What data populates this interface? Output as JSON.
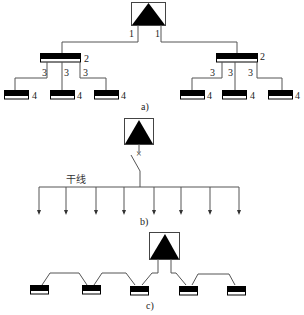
{
  "figure": {
    "colors": {
      "line": "#555555",
      "fill": "#000000",
      "background": "#ffffff"
    }
  },
  "panel_a": {
    "caption": "a)",
    "source_symbol": "transformer-triangle-box",
    "level_labels": {
      "feeder": "1",
      "sub_board": "2",
      "branch": "3",
      "load_board": "4"
    },
    "left_group": {
      "board_label": "2",
      "branch_labels": [
        "3",
        "3",
        "3"
      ],
      "load_labels": [
        "4",
        "4",
        "4"
      ]
    },
    "right_group": {
      "board_label": "2",
      "branch_labels": [
        "3",
        "3",
        "3"
      ],
      "load_labels": [
        "4",
        "4",
        "4"
      ]
    },
    "feeder_labels": [
      "1",
      "1"
    ]
  },
  "panel_b": {
    "caption": "b)",
    "trunk_label": "干线",
    "breaker_mark": "×",
    "branch_count": 8
  },
  "panel_c": {
    "caption": "c)",
    "board_count": 5
  }
}
